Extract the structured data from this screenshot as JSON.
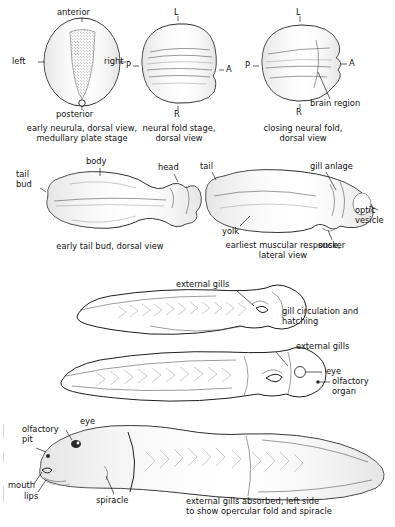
{
  "figure": {
    "background_color": "#ffffff",
    "ink_color": "#1d1d1d"
  },
  "panels": [
    {
      "id": "early-neurula",
      "caption_line1": "early neurula, dorsal view,",
      "caption_line2": "medullary plate stage",
      "labels": [
        {
          "name": "anterior",
          "text": "anterior"
        },
        {
          "name": "left",
          "text": "left"
        },
        {
          "name": "right",
          "text": "right"
        },
        {
          "name": "posterior",
          "text": "posterior"
        }
      ]
    },
    {
      "id": "neural-fold-stage",
      "caption_line1": "neural fold stage,",
      "caption_line2": "dorsal view",
      "labels": [
        {
          "name": "l",
          "text": "L"
        },
        {
          "name": "p",
          "text": "P"
        },
        {
          "name": "a",
          "text": "A"
        },
        {
          "name": "r",
          "text": "R"
        }
      ]
    },
    {
      "id": "closing-neural-fold",
      "caption_line1": "closing neural fold,",
      "caption_line2": "dorsal view",
      "labels": [
        {
          "name": "l",
          "text": "L"
        },
        {
          "name": "p",
          "text": "P"
        },
        {
          "name": "a",
          "text": "A"
        },
        {
          "name": "r",
          "text": "R"
        },
        {
          "name": "brain-region",
          "text": "brain region"
        }
      ]
    },
    {
      "id": "early-tail-bud",
      "caption_line1": "early tail bud, dorsal view",
      "caption_line2": "",
      "labels": [
        {
          "name": "tail-bud",
          "text": "tail\nbud"
        },
        {
          "name": "body",
          "text": "body"
        },
        {
          "name": "head",
          "text": "head"
        }
      ]
    },
    {
      "id": "earliest-muscular-response",
      "caption_line1": "earliest muscular response,",
      "caption_line2": "lateral view",
      "labels": [
        {
          "name": "tail",
          "text": "tail"
        },
        {
          "name": "gill-anlage",
          "text": "gill anlage"
        },
        {
          "name": "yolk",
          "text": "yolk"
        },
        {
          "name": "sucker",
          "text": "sucker"
        },
        {
          "name": "optic-vesicle",
          "text": "optic\nvesicle"
        }
      ]
    },
    {
      "id": "gill-circulation-hatching",
      "caption_line1": "gill circulation and",
      "caption_line2": "hatching",
      "labels": [
        {
          "name": "external-gills",
          "text": "external gills"
        }
      ]
    },
    {
      "id": "larva-with-external-gills",
      "caption_line1": "",
      "caption_line2": "",
      "labels": [
        {
          "name": "external-gills",
          "text": "external gills"
        },
        {
          "name": "eye",
          "text": "eye"
        },
        {
          "name": "olfactory-organ",
          "text": "olfactory\norgan"
        }
      ]
    },
    {
      "id": "external-gills-absorbed",
      "caption_line1": "external gills absorbed, left side",
      "caption_line2": "to show opercular fold and spiracle",
      "labels": [
        {
          "name": "olfactory-pit",
          "text": "olfactory\npit"
        },
        {
          "name": "eye",
          "text": "eye"
        },
        {
          "name": "mouth",
          "text": "mouth"
        },
        {
          "name": "lips",
          "text": "lips"
        },
        {
          "name": "spiracle",
          "text": "spiracle"
        }
      ]
    }
  ]
}
